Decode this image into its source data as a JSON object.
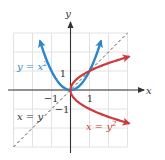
{
  "chart_data": {
    "type": "line",
    "title": "",
    "xlabel": "x",
    "ylabel": "y",
    "xlim": [
      -3,
      3
    ],
    "ylim": [
      -3,
      3
    ],
    "grid": true,
    "series": [
      {
        "name": "y = x^2",
        "label": "y = x",
        "label_sup": "2",
        "color": "#2b86c9",
        "equation": "y = x^2",
        "x_range": [
          -1.6,
          1.6
        ]
      },
      {
        "name": "x = y^2",
        "label": "x = y",
        "label_sup": "2",
        "color": "#d0393b",
        "equation": "x = y^2",
        "y_range": [
          -1.75,
          1.75
        ]
      },
      {
        "name": "x = y",
        "label": "x = y",
        "color": "#555555",
        "style": "dashed",
        "equation": "y = x",
        "x_range": [
          -3,
          3
        ]
      }
    ],
    "tick_labels": {
      "x": [
        {
          "value": -1,
          "text": "−1"
        },
        {
          "value": 1,
          "text": "1"
        }
      ],
      "y": [
        {
          "value": 1,
          "text": "1"
        },
        {
          "value": -1,
          "text": "−1"
        }
      ]
    },
    "annotations": [
      "y = x²",
      "x = y",
      "x = y²"
    ],
    "intersections": [
      [
        0,
        0
      ],
      [
        1,
        1
      ]
    ]
  },
  "axes": {
    "x_label": "x",
    "y_label": "y"
  },
  "labels": {
    "blue_curve": {
      "base": "y = x",
      "sup": "2"
    },
    "red_curve": {
      "base": "x = y",
      "sup": "2"
    },
    "dashed_line": "x = y"
  },
  "ticks": {
    "x_neg1": "−1",
    "x_pos1": "1",
    "y_pos1": "1",
    "y_neg1": "−1"
  },
  "colors": {
    "blue": "#2b86c9",
    "red": "#d0393b",
    "grid": "#e2e2e2",
    "axis": "#333333",
    "dashed": "#555555"
  }
}
